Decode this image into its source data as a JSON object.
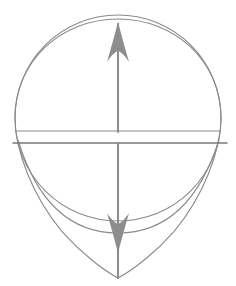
{
  "figure": {
    "background_color": "#ffffff",
    "canvas": {
      "width": 236,
      "height": 286
    },
    "stroke_color": "#8a8a8a",
    "stroke_color_dark": "#7a7a7a",
    "arrow_fill_color": "#8d8d8d",
    "stroke_width": 1.1
  },
  "geometry": {
    "center": {
      "x": 118,
      "y": 118
    },
    "circle": {
      "cx": 118,
      "cy": 118,
      "r": 103,
      "top_y": 19,
      "bottom_y": 221,
      "left_x": 15,
      "right_x": 221
    },
    "teardrop": {
      "apex_top": {
        "x": 118,
        "y": 19
      },
      "apex_bottom": {
        "x": 118,
        "y": 278
      },
      "left_x": 15,
      "right_x": 221,
      "shoulder_y": 140
    },
    "bowl_arc": {
      "left": {
        "x": 18,
        "y": 140
      },
      "right": {
        "x": 219,
        "y": 140
      },
      "sag_y": 222
    },
    "upper_horizontal": {
      "x1": 17,
      "x2": 220,
      "y": 131
    },
    "lower_horizontal": {
      "x1": 13,
      "x2": 227,
      "y": 143
    },
    "vertical_axis": {
      "x": 118,
      "y_top": 22,
      "y_bottom": 278
    },
    "arrow_up": {
      "tip": {
        "x": 118,
        "y": 22
      },
      "base_y": 62,
      "half_width": 11
    },
    "arrow_down": {
      "tip": {
        "x": 118,
        "y": 253
      },
      "base_y": 213,
      "half_width": 11
    },
    "shaft_gap": {
      "y_start": 131,
      "y_end": 143
    }
  },
  "labels": {
    "figure_caption": "",
    "annotations": []
  }
}
